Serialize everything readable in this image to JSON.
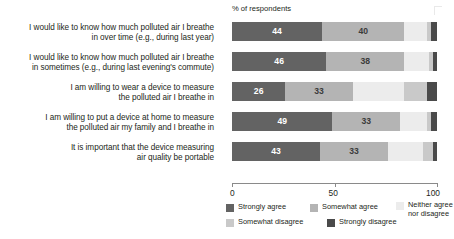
{
  "header": {
    "axis_title": "% of respondents"
  },
  "chart_data": {
    "type": "bar",
    "orientation": "horizontal",
    "stacked": true,
    "normalized_percent": true,
    "title": "",
    "subtitle": "",
    "xlabel": "% of respondents",
    "ylabel": "",
    "xlim": [
      0,
      100
    ],
    "xticks": [
      0,
      50,
      100
    ],
    "xticklabels": [
      "0",
      "50",
      "100"
    ],
    "grid": false,
    "legend_position": "bottom",
    "categories": [
      "I would like to know how much polluted air I breathe in over time (e.g., during last year)",
      "I would like to know how much polluted air I breathe in sometimes (e.g., during last evening's commute)",
      "I am willing to wear a device to measure the polluted air I breathe in",
      "I am willing to put a device at home to measure the polluted air my family and I breathe in",
      "It is important that the device measuring air quality be portable"
    ],
    "category_lines": [
      [
        "I would like to know how much polluted air I breathe",
        "in over time (e.g., during last year)"
      ],
      [
        "I would like to know how much polluted air I breathe",
        "in sometimes (e.g., during last evening's commute)"
      ],
      [
        "I am willing to wear a device to measure",
        "the polluted air I breathe in"
      ],
      [
        "I am willing to put a device at home to measure",
        "the polluted air my family and I breathe in"
      ],
      [
        "It is important that the device measuring",
        "air quality be portable"
      ]
    ],
    "series": [
      {
        "name": "Strongly agree",
        "color": "#636363",
        "values": [
          44,
          46,
          26,
          49,
          43
        ]
      },
      {
        "name": "Somewhat agree",
        "color": "#b4b4b4",
        "values": [
          40,
          38,
          33,
          33,
          33
        ]
      },
      {
        "name": "Neither agree nor disagree",
        "color": "#ececec",
        "values": [
          11,
          12,
          25,
          13,
          17
        ]
      },
      {
        "name": "Somewhat disagree",
        "color": "#c9c9c9",
        "values": [
          2,
          2,
          11,
          2,
          5
        ]
      },
      {
        "name": "Strongly disagree",
        "color": "#4a4a4a",
        "values": [
          3,
          2,
          5,
          3,
          2
        ]
      }
    ],
    "value_labels": [
      [
        44,
        40,
        null,
        null,
        null
      ],
      [
        46,
        38,
        null,
        null,
        null
      ],
      [
        26,
        33,
        null,
        null,
        null
      ],
      [
        49,
        33,
        null,
        null,
        null
      ],
      [
        43,
        33,
        null,
        null,
        null
      ]
    ]
  },
  "legend": {
    "items": [
      {
        "label": "Strongly agree",
        "color": "#636363"
      },
      {
        "label": "Somewhat agree",
        "color": "#b4b4b4"
      },
      {
        "label": "Neither agree nor disagree",
        "color": "#ececec",
        "line1": "Neither agree",
        "line2": "nor disagree"
      },
      {
        "label": "Somewhat disagree",
        "color": "#c9c9c9"
      },
      {
        "label": "Strongly disagree",
        "color": "#4a4a4a"
      }
    ]
  }
}
